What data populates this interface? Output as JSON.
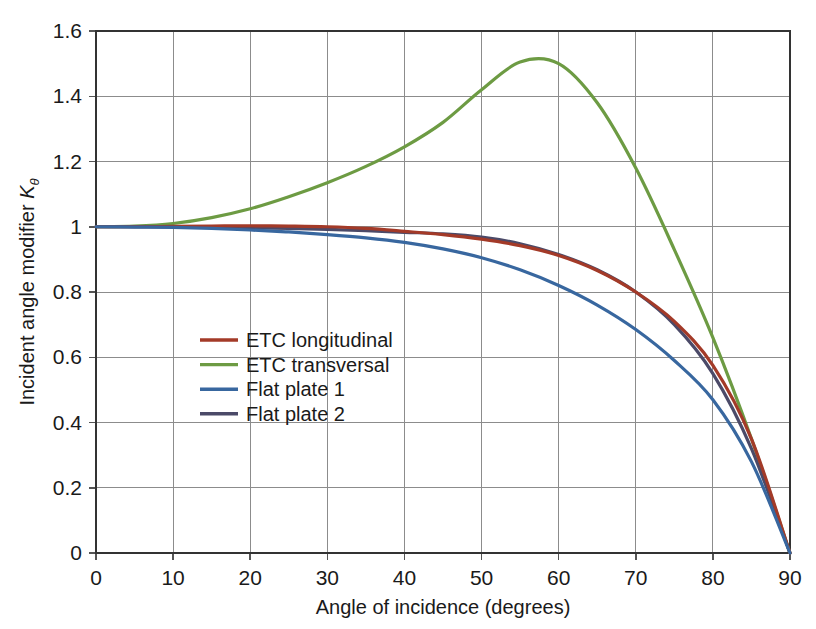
{
  "chart_data": {
    "type": "line",
    "title": "",
    "xlabel": "Angle of incidence (degrees)",
    "ylabel": "Incident angle modifier Kθ",
    "ylabel_main": "Incident angle modifier ",
    "ylabel_symbol": "K",
    "ylabel_subscript": "θ",
    "xlim": [
      0,
      90
    ],
    "ylim": [
      0,
      1.6
    ],
    "xticks": [
      0,
      10,
      20,
      30,
      40,
      50,
      60,
      70,
      80,
      90
    ],
    "xtick_labels": [
      "0",
      "10",
      "20",
      "30",
      "40",
      "50",
      "60",
      "70",
      "80",
      "90"
    ],
    "yticks": [
      0,
      0.2,
      0.4,
      0.6,
      0.8,
      1,
      1.2,
      1.4,
      1.6
    ],
    "ytick_labels": [
      "0",
      "0.2",
      "0.4",
      "0.6",
      "0.8",
      "1",
      "1.2",
      "1.4",
      "1.6"
    ],
    "grid": true,
    "legend_position": "center-left-inside",
    "x": [
      0,
      5,
      10,
      15,
      20,
      25,
      30,
      35,
      40,
      45,
      50,
      55,
      60,
      65,
      70,
      75,
      80,
      85,
      90
    ],
    "series": [
      {
        "name": "ETC longitudinal",
        "color": "#a33a28",
        "values": [
          1.0,
          1.0,
          1.001,
          1.002,
          1.003,
          1.002,
          1.0,
          0.995,
          0.986,
          0.976,
          0.962,
          0.942,
          0.912,
          0.866,
          0.8,
          0.71,
          0.575,
          0.35,
          0.0
        ]
      },
      {
        "name": "ETC transversal",
        "color": "#6d9b43",
        "values": [
          1.0,
          1.002,
          1.01,
          1.028,
          1.055,
          1.092,
          1.135,
          1.185,
          1.245,
          1.32,
          1.42,
          1.505,
          1.5,
          1.38,
          1.18,
          0.93,
          0.66,
          0.35,
          0.0
        ]
      },
      {
        "name": "Flat plate 1",
        "color": "#38679f",
        "values": [
          1.0,
          0.999,
          0.998,
          0.995,
          0.99,
          0.984,
          0.976,
          0.966,
          0.952,
          0.932,
          0.905,
          0.868,
          0.82,
          0.76,
          0.685,
          0.59,
          0.47,
          0.28,
          0.0
        ]
      },
      {
        "name": "Flat plate 2",
        "color": "#4b4a68",
        "values": [
          1.0,
          1.0,
          1.0,
          0.999,
          0.997,
          0.995,
          0.992,
          0.988,
          0.983,
          0.978,
          0.968,
          0.948,
          0.915,
          0.868,
          0.8,
          0.7,
          0.55,
          0.32,
          0.0
        ]
      }
    ]
  },
  "legend": {
    "items": [
      {
        "label": "ETC longitudinal",
        "color": "#a33a28"
      },
      {
        "label": "ETC transversal",
        "color": "#6d9b43"
      },
      {
        "label": "Flat plate 1",
        "color": "#38679f"
      },
      {
        "label": "Flat plate 2",
        "color": "#4b4a68"
      }
    ]
  }
}
